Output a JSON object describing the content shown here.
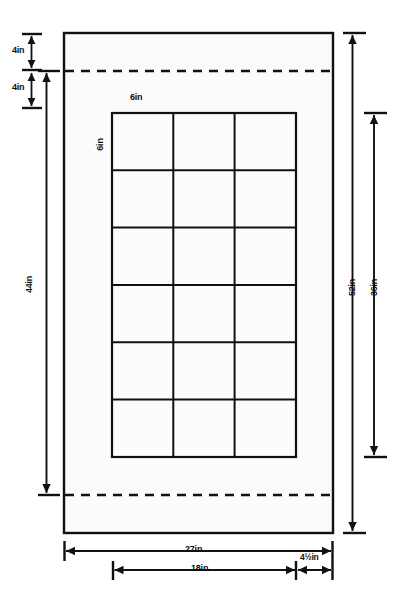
{
  "drawing": {
    "title": "Dimensioned layout drawing",
    "units": "inches",
    "line_color": "#111111",
    "fill_color": "#fbfbfb",
    "background_color": "#ffffff"
  },
  "outer_panel": {
    "name": "outer-rectangle",
    "width_label": "27in",
    "height_label": "52in"
  },
  "grid": {
    "name": "inner-grid",
    "columns": 3,
    "rows": 6,
    "cell_width_label": "6in",
    "cell_height_label": "6in",
    "total_width_label": "18in",
    "total_height_label": "36in"
  },
  "dashed_lines": {
    "top": {
      "label": "top-dashed-line"
    },
    "bottom": {
      "label": "bottom-dashed-line"
    }
  },
  "dimensions": {
    "top_margin": "4in",
    "second_margin": "4in",
    "left_overall": "44in",
    "grid_cell_horizontal": "6in",
    "grid_cell_vertical": "6in",
    "right_overall": "52in",
    "right_inner": "36in",
    "bottom_overall": "27in",
    "bottom_inner": "18in",
    "bottom_offset": "4½in"
  }
}
